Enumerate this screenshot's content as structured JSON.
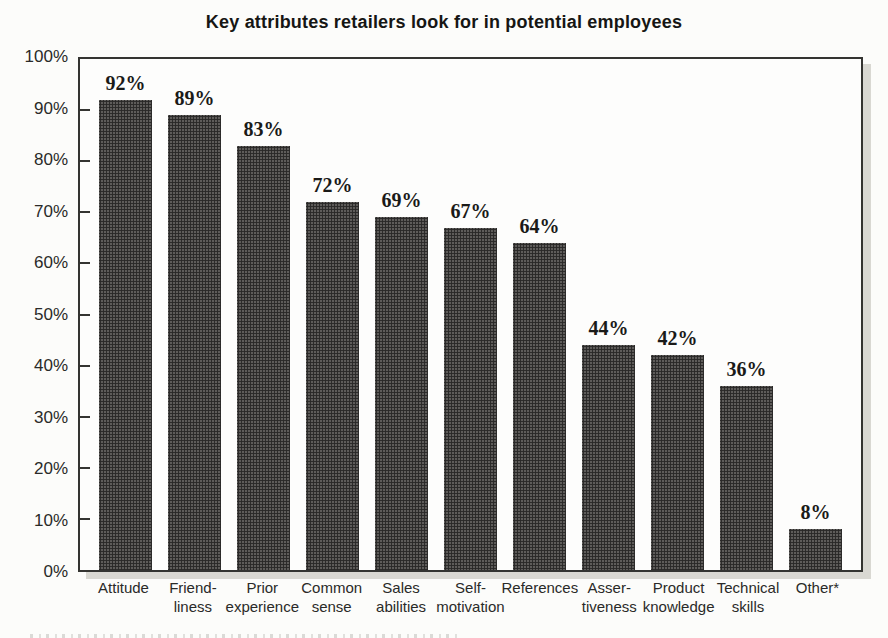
{
  "title": "Key attributes retailers look for in potential employees",
  "chart_data": {
    "type": "bar",
    "title": "Key attributes retailers look for in potential employees",
    "categories": [
      "Attitude",
      "Friendliness",
      "Prior experience",
      "Common sense",
      "Sales abilities",
      "Self-motivation",
      "References",
      "Assertiveness",
      "Product knowledge",
      "Technical skills",
      "Other*"
    ],
    "values": [
      92,
      89,
      83,
      72,
      69,
      67,
      64,
      44,
      42,
      36,
      8
    ],
    "value_labels": [
      "92%",
      "89%",
      "83%",
      "72%",
      "69%",
      "67%",
      "64%",
      "44%",
      "42%",
      "36%",
      "8%"
    ],
    "category_label_lines": [
      [
        "Attitude"
      ],
      [
        "Friend-",
        "liness"
      ],
      [
        "Prior",
        "experience"
      ],
      [
        "Common",
        "sense"
      ],
      [
        "Sales",
        "abilities"
      ],
      [
        "Self-",
        "motivation"
      ],
      [
        "References"
      ],
      [
        "Asser-",
        "tiveness"
      ],
      [
        "Product",
        "knowledge"
      ],
      [
        "Technical",
        "skills"
      ],
      [
        "Other*"
      ]
    ],
    "y_tick_labels": [
      "100%",
      "90%",
      "80%",
      "70%",
      "60%",
      "50%",
      "40%",
      "30%",
      "20%",
      "10%",
      "0%"
    ],
    "ylim": [
      0,
      100
    ],
    "xlabel": "",
    "ylabel": "",
    "grid": false,
    "legend": null,
    "bar_color": "#504e4c",
    "border_color": "#343431",
    "background_color": "#fcfcfa"
  }
}
